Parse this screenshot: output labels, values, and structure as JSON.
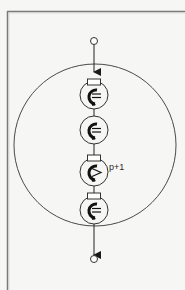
{
  "diagram": {
    "type": "pipeline-ring",
    "frame": {
      "left": 7,
      "top": 11,
      "stroke": "#8a8a8a"
    },
    "outer_ring": {
      "cx": 95,
      "cy": 145,
      "r": 81,
      "stroke": "#555555"
    },
    "input_terminal": {
      "cx": 94,
      "cy": 41,
      "r": 3.5
    },
    "output_terminal": {
      "cx": 94,
      "cy": 259,
      "r": 3.5
    },
    "flow_direction": "top-to-bottom",
    "stages": [
      {
        "id": 1,
        "cy": 95,
        "has_register": true,
        "glyph": "c-equals",
        "label": ""
      },
      {
        "id": 2,
        "cy": 130,
        "has_register": false,
        "glyph": "c-equals",
        "label": ""
      },
      {
        "id": 3,
        "cy": 172,
        "has_register": true,
        "glyph": "c-greater",
        "label": "p+1"
      },
      {
        "id": 4,
        "cy": 210,
        "has_register": true,
        "glyph": "c-equals",
        "label": ""
      }
    ],
    "stage_label": "p+1",
    "colors": {
      "line": "#333333",
      "background": "#f6f6f4",
      "glyph": "#1a1a1a"
    }
  }
}
